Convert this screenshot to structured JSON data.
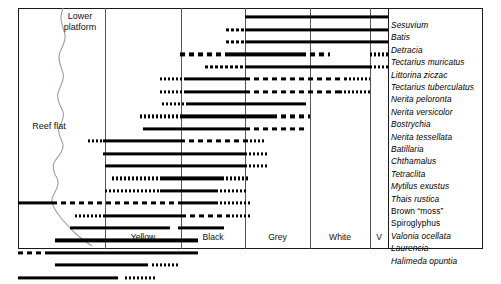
{
  "figure": {
    "type": "range-chart"
  },
  "regions": {
    "lower_platform": "Lower\nplatform",
    "lower_platform_line1": "Lower",
    "lower_platform_line2": "platform",
    "reef_flat": "Reef flat"
  },
  "zones": [
    {
      "name": "Yellow",
      "center_x": 143,
      "left": 105,
      "right": 181
    },
    {
      "name": "Black",
      "center_x": 213,
      "left": 181,
      "right": 245
    },
    {
      "name": "Grey",
      "center_x": 277,
      "left": 245,
      "right": 310
    },
    {
      "name": "White",
      "center_x": 340,
      "left": 310,
      "right": 370
    },
    {
      "name": "V",
      "center_x": 379,
      "left": 370,
      "right": 388
    }
  ],
  "gridlines_x": [
    105,
    181,
    245,
    310,
    370,
    388
  ],
  "frame": {
    "left": 18,
    "top": 8,
    "width": 465,
    "height": 241,
    "right": 483
  },
  "row_height": 12.4,
  "row_start_y": 11,
  "species": [
    {
      "label": "Sesuvium",
      "italic": true,
      "segments": [
        {
          "x1": 245,
          "x2": 388,
          "style": "solid"
        }
      ]
    },
    {
      "label": "Batis",
      "italic": true,
      "segments": [
        {
          "x1": 226,
          "x2": 245,
          "style": "dashfine"
        },
        {
          "x1": 245,
          "x2": 388,
          "style": "solid"
        }
      ]
    },
    {
      "label": "Detracia",
      "italic": true,
      "segments": [
        {
          "x1": 226,
          "x2": 245,
          "style": "dashfine"
        },
        {
          "x1": 245,
          "x2": 388,
          "style": "solid"
        }
      ]
    },
    {
      "label": "Tectarius muricatus",
      "italic": true,
      "segments": [
        {
          "x1": 180,
          "x2": 228,
          "style": "dash"
        },
        {
          "x1": 228,
          "x2": 301,
          "style": "solid"
        },
        {
          "x1": 301,
          "x2": 330,
          "style": "dash"
        },
        {
          "x1": 370,
          "x2": 388,
          "style": "dot"
        }
      ]
    },
    {
      "label": "Littorina ziczac",
      "italic": true,
      "segments": [
        {
          "x1": 205,
          "x2": 245,
          "style": "dashfine"
        },
        {
          "x1": 245,
          "x2": 370,
          "style": "solid"
        },
        {
          "x1": 370,
          "x2": 388,
          "style": "dot"
        }
      ]
    },
    {
      "label": "Tectarius tuberculatus",
      "italic": true,
      "segments": [
        {
          "x1": 160,
          "x2": 186,
          "style": "dot"
        },
        {
          "x1": 186,
          "x2": 245,
          "style": "solid"
        },
        {
          "x1": 245,
          "x2": 345,
          "style": "dash"
        },
        {
          "x1": 345,
          "x2": 370,
          "style": "dot"
        }
      ]
    },
    {
      "label": "Nerita peloronta",
      "italic": true,
      "segments": [
        {
          "x1": 160,
          "x2": 186,
          "style": "dot"
        },
        {
          "x1": 186,
          "x2": 245,
          "style": "solid"
        },
        {
          "x1": 245,
          "x2": 340,
          "style": "dash"
        },
        {
          "x1": 340,
          "x2": 370,
          "style": "dot"
        }
      ]
    },
    {
      "label": "Nerita versicolor",
      "italic": true,
      "segments": [
        {
          "x1": 162,
          "x2": 186,
          "style": "dot"
        },
        {
          "x1": 186,
          "x2": 306,
          "style": "solid"
        }
      ]
    },
    {
      "label": "Bostrychia",
      "italic": true,
      "segments": [
        {
          "x1": 140,
          "x2": 182,
          "style": "dot"
        },
        {
          "x1": 182,
          "x2": 272,
          "style": "solid"
        },
        {
          "x1": 272,
          "x2": 310,
          "style": "dash"
        }
      ]
    },
    {
      "label": "Nerita tessellata",
      "italic": true,
      "segments": [
        {
          "x1": 143,
          "x2": 245,
          "style": "solid"
        },
        {
          "x1": 245,
          "x2": 305,
          "style": "dash"
        }
      ]
    },
    {
      "label": "Batillaria",
      "italic": true,
      "segments": [
        {
          "x1": 88,
          "x2": 103,
          "style": "dot"
        },
        {
          "x1": 103,
          "x2": 180,
          "style": "solid"
        },
        {
          "x1": 180,
          "x2": 250,
          "style": "dash"
        },
        {
          "x1": 250,
          "x2": 266,
          "style": "dot"
        }
      ]
    },
    {
      "label": "Chthamalus",
      "italic": true,
      "segments": [
        {
          "x1": 103,
          "x2": 245,
          "style": "solid"
        },
        {
          "x1": 245,
          "x2": 268,
          "style": "dot"
        }
      ]
    },
    {
      "label": "Tetraclita",
      "italic": true,
      "segments": [
        {
          "x1": 105,
          "x2": 245,
          "style": "solid"
        },
        {
          "x1": 245,
          "x2": 268,
          "style": "dot"
        }
      ]
    },
    {
      "label": "Mytilus exustus",
      "italic": true,
      "segments": [
        {
          "x1": 112,
          "x2": 160,
          "style": "dot"
        },
        {
          "x1": 160,
          "x2": 222,
          "style": "solid"
        },
        {
          "x1": 222,
          "x2": 250,
          "style": "dot"
        }
      ]
    },
    {
      "label": "Thais rustica",
      "italic": true,
      "segments": [
        {
          "x1": 105,
          "x2": 160,
          "style": "dot"
        },
        {
          "x1": 160,
          "x2": 216,
          "style": "solid"
        },
        {
          "x1": 216,
          "x2": 248,
          "style": "dot"
        }
      ]
    },
    {
      "label": "Brown “moss”",
      "italic": false,
      "segments": [
        {
          "x1": 18,
          "x2": 52,
          "style": "solid"
        },
        {
          "x1": 52,
          "x2": 180,
          "style": "dash"
        },
        {
          "x1": 180,
          "x2": 216,
          "style": "solid"
        },
        {
          "x1": 216,
          "x2": 250,
          "style": "dot"
        }
      ]
    },
    {
      "label": "Spiroglyphus",
      "italic": false,
      "segments": [
        {
          "x1": 75,
          "x2": 105,
          "style": "dot"
        },
        {
          "x1": 105,
          "x2": 181,
          "style": "solid"
        },
        {
          "x1": 181,
          "x2": 228,
          "style": "dash"
        },
        {
          "x1": 228,
          "x2": 250,
          "style": "dot"
        }
      ]
    },
    {
      "label": "Valonia ocellata",
      "italic": true,
      "segments": [
        {
          "x1": 70,
          "x2": 170,
          "style": "solid"
        },
        {
          "x1": 178,
          "x2": 224,
          "style": "solid"
        }
      ]
    },
    {
      "label": "Laurencia",
      "italic": true,
      "segments": [
        {
          "x1": 55,
          "x2": 198,
          "style": "solid"
        }
      ]
    },
    {
      "label": "Halimeda opuntia",
      "italic": true,
      "segments": [
        {
          "x1": 18,
          "x2": 48,
          "style": "dash"
        },
        {
          "x1": 48,
          "x2": 198,
          "style": "solid"
        }
      ]
    },
    {
      "label": "",
      "italic": true,
      "segments": [
        {
          "x1": 55,
          "x2": 148,
          "style": "solid"
        },
        {
          "x1": 152,
          "x2": 180,
          "style": "dot"
        }
      ]
    },
    {
      "label": "",
      "italic": true,
      "segments": [
        {
          "x1": 18,
          "x2": 118,
          "style": "solid"
        },
        {
          "x1": 125,
          "x2": 155,
          "style": "dot"
        }
      ]
    }
  ]
}
